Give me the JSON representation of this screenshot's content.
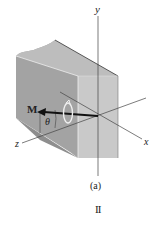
{
  "figure": {
    "axes": {
      "y_label": "y",
      "x_label": "x",
      "z_label": "z"
    },
    "moment_label": "M",
    "angle_label": "θ",
    "caption": "(a)",
    "page_marker": "II"
  },
  "colors": {
    "top_face": "#b8b8b8",
    "left_face": "#9a9a9a",
    "front_face": "#c6c6c6",
    "axis": "#333333",
    "arrow": "#111111"
  }
}
